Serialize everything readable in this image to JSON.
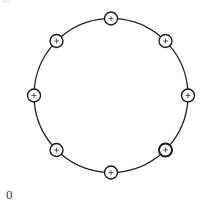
{
  "figure": {
    "title": "",
    "background_color": "#ffffff",
    "width": 207,
    "height": 211,
    "origin_label": "0",
    "origin_label_color": "#3c3c3f"
  },
  "chart_data": {
    "type": "diagram",
    "subtype": "ring-graph",
    "title": "",
    "xlabel": "",
    "ylabel": "",
    "grid": false,
    "legend": null,
    "annotations": [
      "0"
    ],
    "layout": {
      "center_x": 111,
      "center_y": 95.5,
      "radius": 77,
      "node_count": 8,
      "node_radius": 6.5,
      "edge_count": 8,
      "edge_color": "#1e1e20",
      "edge_width": 1.25,
      "node_fill": "#ffffff",
      "node_stroke": "#18181a"
    },
    "nodes": [
      {
        "id": 0,
        "label": "+",
        "angle_deg": 90,
        "x": 111,
        "y": 18.5,
        "emphasis": false
      },
      {
        "id": 1,
        "label": "+",
        "angle_deg": 45,
        "x": 165.5,
        "y": 41,
        "emphasis": false
      },
      {
        "id": 2,
        "label": "+",
        "angle_deg": 0,
        "x": 188,
        "y": 95.5,
        "emphasis": false
      },
      {
        "id": 3,
        "label": "+",
        "angle_deg": 315,
        "x": 165.5,
        "y": 150,
        "emphasis": true
      },
      {
        "id": 4,
        "label": "+",
        "angle_deg": 270,
        "x": 111,
        "y": 172.5,
        "emphasis": false
      },
      {
        "id": 5,
        "label": "+",
        "angle_deg": 225,
        "x": 56.5,
        "y": 150,
        "emphasis": false
      },
      {
        "id": 6,
        "label": "+",
        "angle_deg": 180,
        "x": 34,
        "y": 95.5,
        "emphasis": false
      },
      {
        "id": 7,
        "label": "+",
        "angle_deg": 135,
        "x": 56.5,
        "y": 41,
        "emphasis": false
      }
    ],
    "edges": [
      {
        "source": 0,
        "target": 1
      },
      {
        "source": 1,
        "target": 2
      },
      {
        "source": 2,
        "target": 3
      },
      {
        "source": 3,
        "target": 4
      },
      {
        "source": 4,
        "target": 5
      },
      {
        "source": 5,
        "target": 6
      },
      {
        "source": 6,
        "target": 7
      },
      {
        "source": 7,
        "target": 0
      }
    ]
  }
}
